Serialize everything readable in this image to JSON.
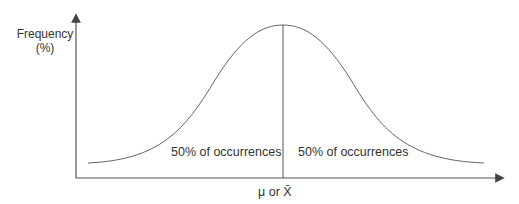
{
  "diagram": {
    "type": "normal-distribution-curve",
    "y_axis_label_line1": "Frequency",
    "y_axis_label_line2": "(%)",
    "x_axis_label": "μ or X̄",
    "left_half_label": "50% of occurrences",
    "right_half_label": "50% of occurrences",
    "colors": {
      "line": "#555555",
      "text": "#333333",
      "background": "#ffffff"
    }
  }
}
